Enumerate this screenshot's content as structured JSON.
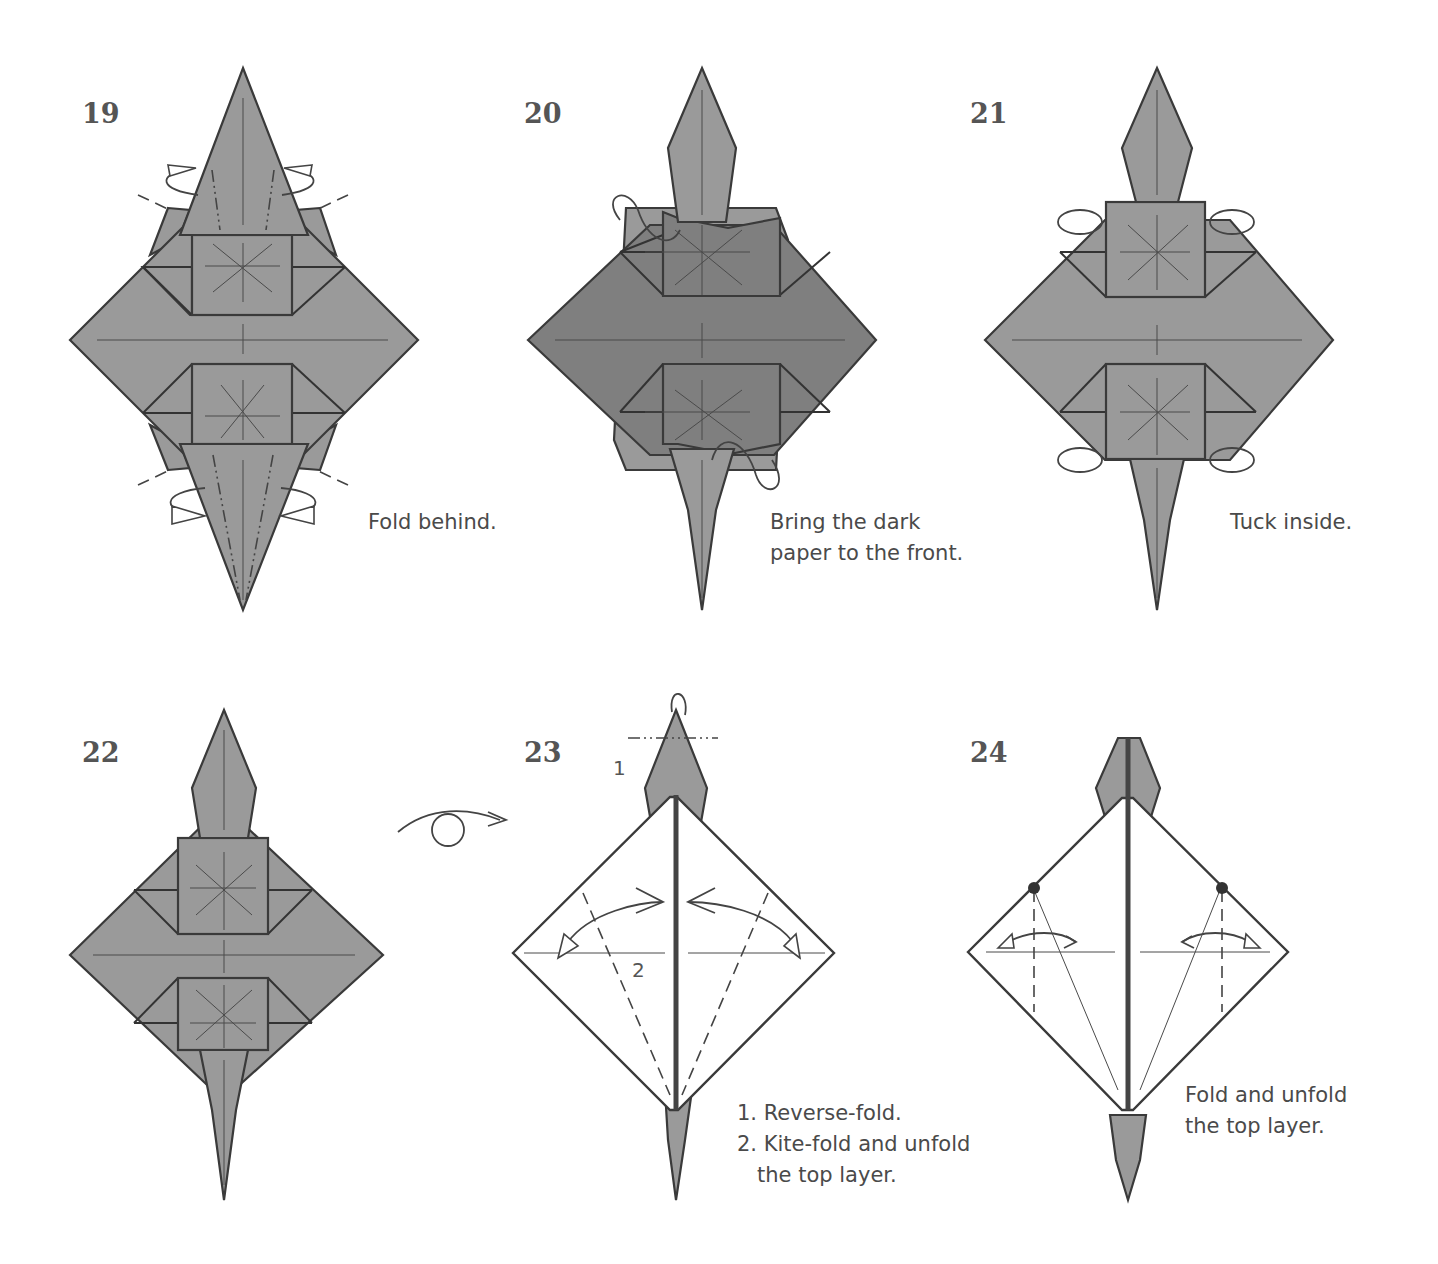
{
  "diagram": {
    "type": "origami-folding-instructions",
    "steps": [
      {
        "number": "19",
        "caption": "Fold behind.",
        "paper": "gray",
        "symbols": [
          "mountain-fold-lines",
          "fold-behind-arrows"
        ]
      },
      {
        "number": "20",
        "caption": "Bring the dark\npaper to the front.",
        "paper": "dark-gray",
        "symbols": [
          "push-arrows"
        ]
      },
      {
        "number": "21",
        "caption": "Tuck inside.",
        "paper": "gray",
        "symbols": [
          "tuck-arrows"
        ]
      },
      {
        "number": "22",
        "caption": "",
        "paper": "gray",
        "symbols": [
          "turn-over-arrow"
        ]
      },
      {
        "number": "23",
        "caption": "1. Reverse-fold.\n2. Kite-fold and unfold\n   the top layer.",
        "labels": [
          "1",
          "2"
        ],
        "paper": "white-inside",
        "symbols": [
          "reverse-fold",
          "kite-fold-valley-lines",
          "fold-unfold-arrows"
        ]
      },
      {
        "number": "24",
        "caption": "Fold and unfold\nthe top layer.",
        "paper": "white-inside",
        "symbols": [
          "reference-dots",
          "valley-lines",
          "fold-unfold-arrows"
        ]
      }
    ]
  },
  "colors": {
    "paper": "#9a9a9a",
    "paper_dark": "#7f7f7f",
    "line": "#3a3a3a",
    "background": "#ffffff",
    "text": "#4a4a4a"
  }
}
